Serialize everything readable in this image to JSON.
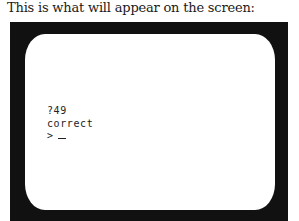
{
  "caption": "This is what will appear on the screen:",
  "screen": {
    "lines": [
      "?49",
      "correct"
    ],
    "prompt": ">",
    "cursor": "_"
  },
  "colors": {
    "frame": "#111111",
    "screen": "#ffffff",
    "text": "#222222"
  }
}
